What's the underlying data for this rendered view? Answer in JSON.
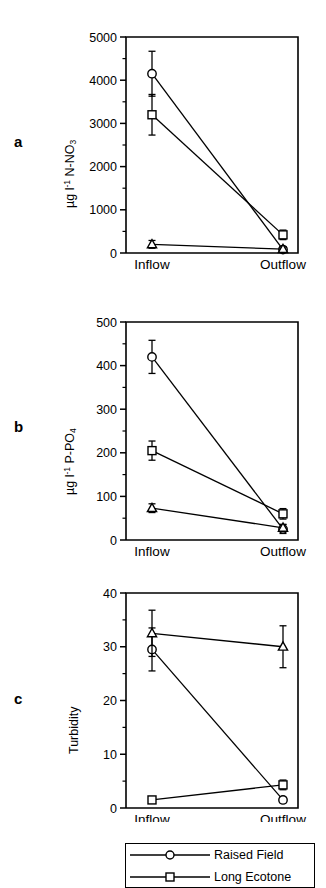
{
  "figure": {
    "panels": [
      {
        "letter": "a",
        "ylabel_prefix": "µg l",
        "ylabel_sup": "-1",
        "ylabel_mid": " N-NO",
        "ylabel_sub": "3"
      },
      {
        "letter": "b",
        "ylabel_prefix": "µg l",
        "ylabel_sup": "-1",
        "ylabel_mid": " P-PO",
        "ylabel_sub": "4"
      },
      {
        "letter": "c",
        "ylabel_prefix": "Turbidity",
        "ylabel_sup": "",
        "ylabel_mid": "",
        "ylabel_sub": ""
      }
    ]
  },
  "legend": {
    "title": "",
    "entries": [
      {
        "label": "Raised Field",
        "marker": "circle"
      },
      {
        "label": "Long Ecotone",
        "marker": "square"
      }
    ]
  },
  "chart_data": [
    {
      "type": "line",
      "panel": "a",
      "title": "",
      "xlabel": "",
      "ylabel": "µg l-1 N-NO3",
      "categories": [
        "Inflow",
        "Outflow"
      ],
      "ylim": [
        0,
        5000
      ],
      "yticks": [
        0,
        1000,
        2000,
        3000,
        4000,
        5000
      ],
      "yticklabels": [
        "0",
        "1000",
        "2000",
        "3000",
        "4000",
        "5000"
      ],
      "minor_ticks": true,
      "grid": false,
      "legend_position": "below-figure",
      "series": [
        {
          "name": "Raised Field",
          "marker": "circle",
          "values": [
            4150,
            80
          ],
          "errors": [
            520,
            60
          ]
        },
        {
          "name": "Long Ecotone",
          "marker": "square",
          "values": [
            3200,
            420
          ],
          "errors": [
            470,
            110
          ]
        },
        {
          "name": "Short Ecotone",
          "marker": "triangle",
          "values": [
            200,
            90
          ],
          "errors": [
            90,
            50
          ]
        }
      ]
    },
    {
      "type": "line",
      "panel": "b",
      "title": "",
      "xlabel": "",
      "ylabel": "µg l-1 P-PO4",
      "categories": [
        "Inflow",
        "Outflow"
      ],
      "ylim": [
        0,
        500
      ],
      "yticks": [
        0,
        100,
        200,
        300,
        400,
        500
      ],
      "yticklabels": [
        "0",
        "100",
        "200",
        "300",
        "400",
        "500"
      ],
      "minor_ticks": true,
      "grid": false,
      "legend_position": "below-figure",
      "series": [
        {
          "name": "Raised Field",
          "marker": "circle",
          "values": [
            420,
            25
          ],
          "errors": [
            38,
            10
          ]
        },
        {
          "name": "Long Ecotone",
          "marker": "square",
          "values": [
            205,
            60
          ],
          "errors": [
            22,
            12
          ]
        },
        {
          "name": "Short Ecotone",
          "marker": "triangle",
          "values": [
            73,
            28
          ],
          "errors": [
            10,
            8
          ]
        }
      ]
    },
    {
      "type": "line",
      "panel": "c",
      "title": "",
      "xlabel": "",
      "ylabel": "Turbidity",
      "categories": [
        "Inflow",
        "Outflow"
      ],
      "ylim": [
        0,
        40
      ],
      "yticks": [
        0,
        10,
        20,
        30,
        40
      ],
      "yticklabels": [
        "0",
        "10",
        "20",
        "30",
        "40"
      ],
      "minor_ticks": true,
      "grid": false,
      "legend_position": "below-figure",
      "series": [
        {
          "name": "Raised Field",
          "marker": "circle",
          "values": [
            29.5,
            1.5
          ],
          "errors": [
            4.0,
            0.5
          ]
        },
        {
          "name": "Long Ecotone",
          "marker": "square",
          "values": [
            1.5,
            4.3
          ],
          "errors": [
            0.4,
            0.9
          ]
        },
        {
          "name": "Short Ecotone",
          "marker": "triangle",
          "values": [
            32.5,
            30.0
          ],
          "errors": [
            4.3,
            3.9
          ]
        }
      ]
    }
  ]
}
